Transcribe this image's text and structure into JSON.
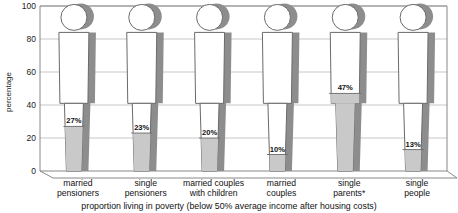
{
  "chart_data": {
    "type": "bar",
    "title": "",
    "subtitle": "",
    "caption": "proportion living in poverty (below 50% average income after housing costs)",
    "categories": [
      "married pensioners",
      "single pensioners",
      "married couples with children",
      "married couples",
      "single parents*",
      "single people"
    ],
    "category_lines": [
      [
        "married",
        "pensioners"
      ],
      [
        "single",
        "pensioners"
      ],
      [
        "married couples",
        "with children"
      ],
      [
        "married",
        "couples"
      ],
      [
        "single",
        "parents*"
      ],
      [
        "single",
        "people"
      ]
    ],
    "values": [
      27,
      23,
      20,
      10,
      47,
      13
    ],
    "value_labels": [
      "27%",
      "23%",
      "20%",
      "10%",
      "47%",
      "13%"
    ],
    "xlabel": "",
    "ylabel": "percentage",
    "ylim": [
      0,
      100
    ],
    "yticks": [
      0,
      20,
      40,
      60,
      80,
      100
    ],
    "ytick_labels": [
      "0",
      "20",
      "40",
      "60",
      "80",
      "100"
    ],
    "grid": true,
    "legend": "none",
    "units": "percent",
    "marker_style": "human-pictogram-bar"
  },
  "colors": {
    "figure_fill": "#c9c9c9",
    "figure_outline": "#6a6a6a",
    "figure_shadow": "#8d8d8d",
    "background": "#ffffff",
    "gridline": "#b9b9b9",
    "text": "#111111"
  }
}
